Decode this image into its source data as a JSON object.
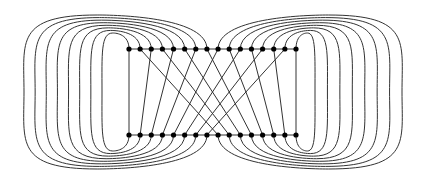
{
  "diagram": {
    "type": "graph",
    "colors": {
      "stroke": "#333333",
      "node": "#000000",
      "background": "#ffffff"
    },
    "rows": {
      "top_y": 49,
      "bottom_y": 135,
      "count": 16,
      "x_start": 129,
      "x_end": 296
    },
    "straight_edges": [
      [
        0,
        0
      ],
      [
        2,
        1
      ],
      [
        4,
        2
      ],
      [
        6,
        3
      ],
      [
        8,
        4
      ],
      [
        10,
        5
      ],
      [
        12,
        6
      ],
      [
        14,
        7
      ],
      [
        1,
        8
      ],
      [
        3,
        9
      ],
      [
        5,
        10
      ],
      [
        7,
        11
      ],
      [
        9,
        12
      ],
      [
        11,
        13
      ],
      [
        13,
        14
      ],
      [
        15,
        15
      ]
    ],
    "left_loops": {
      "nodes": [
        0,
        1,
        2,
        3,
        4,
        5,
        6,
        7
      ],
      "inner_extent_x": 102,
      "outer_extent_x": 24,
      "inner_top_y": 33,
      "outer_top_y": 15
    },
    "right_loops": {
      "nodes": [
        15,
        14,
        13,
        12,
        11,
        10,
        9,
        8
      ],
      "inner_extent_x": 315,
      "outer_extent_x": 402,
      "inner_top_y": 33,
      "outer_top_y": 15
    }
  }
}
